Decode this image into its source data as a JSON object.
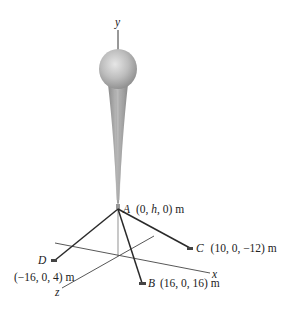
{
  "figure": {
    "axes": {
      "x_label": "x",
      "y_label": "y",
      "z_label": "z"
    },
    "points": {
      "A": {
        "name": "A",
        "coords": "(0, h, 0) m"
      },
      "B": {
        "name": "B",
        "coords": "(16, 0, 16) m"
      },
      "C": {
        "name": "C",
        "coords": "(10, 0, −12) m"
      },
      "D": {
        "name": "D",
        "coords": "(−16, 0, 4) m"
      }
    },
    "colors": {
      "cable": "#2a2a2a",
      "axis": "#444444",
      "balloon": "#b8b8b8",
      "tether": "#9a9a9a"
    }
  }
}
